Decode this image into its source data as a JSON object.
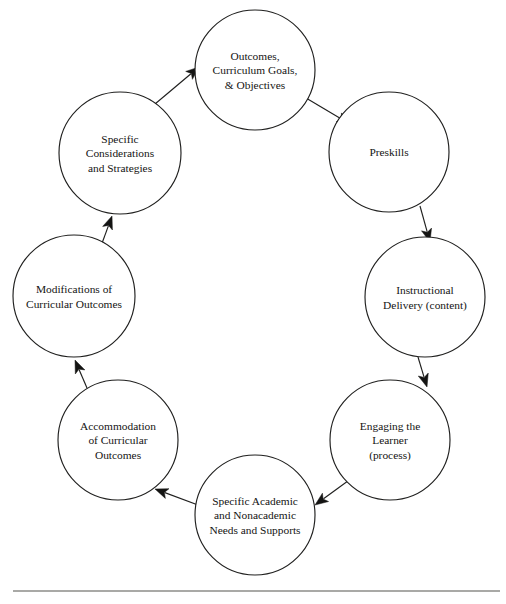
{
  "diagram": {
    "type": "cycle",
    "node_count": 8,
    "stroke_color": "#20201f",
    "arrow_color": "#141413",
    "background_color": "#ffffff",
    "rule_color": "#55544f",
    "nodes": [
      {
        "id": "outcomes",
        "name": "outcomes-curriculum-goals-objectives",
        "lines": [
          "Outcomes,",
          "Curriculum Goals,",
          "& Objectives"
        ],
        "cx": 255,
        "cy": 70,
        "r": 60
      },
      {
        "id": "preskills",
        "name": "preskills",
        "lines": [
          "Preskills"
        ],
        "cx": 389,
        "cy": 152,
        "r": 60
      },
      {
        "id": "instructional-delivery",
        "name": "instructional-delivery-content",
        "lines": [
          "Instructional",
          "Delivery (content)"
        ],
        "cx": 425,
        "cy": 297,
        "r": 60
      },
      {
        "id": "engaging-learner",
        "name": "engaging-the-learner-process",
        "lines": [
          "Engaging the",
          "Learner",
          "(process)"
        ],
        "cx": 390,
        "cy": 440,
        "r": 60
      },
      {
        "id": "specific-academic-needs",
        "name": "specific-academic-and-nonacademic-needs-and-supports",
        "lines": [
          "Specific Academic",
          "and Nonacademic",
          "Needs and Supports"
        ],
        "cx": 255,
        "cy": 515,
        "r": 60
      },
      {
        "id": "accommodation",
        "name": "accommodation-of-curricular-outcomes",
        "lines": [
          "Accommodation",
          "of Curricular",
          "Outcomes"
        ],
        "cx": 118,
        "cy": 440,
        "r": 60
      },
      {
        "id": "modifications",
        "name": "modifications-of-curricular-outcomes",
        "lines": [
          "Modifications of",
          "Curricular Outcomes"
        ],
        "cx": 74,
        "cy": 296,
        "r": 61
      },
      {
        "id": "specific-considerations",
        "name": "specific-considerations-and-strategies",
        "lines": [
          "Specific",
          "Considerations",
          "and Strategies"
        ],
        "cx": 120,
        "cy": 153,
        "r": 61
      }
    ],
    "arrows": [
      {
        "id": "outcomes-to-preskills",
        "from": "outcomes",
        "to": "preskills",
        "x1": 306,
        "y1": 98,
        "x2": 350,
        "y2": 124
      },
      {
        "id": "preskills-to-instructional-delivery",
        "from": "preskills",
        "to": "instructional-delivery",
        "x1": 420,
        "y1": 206,
        "x2": 430,
        "y2": 242
      },
      {
        "id": "instructional-delivery-to-engaging-learner",
        "from": "instructional-delivery",
        "to": "engaging-learner",
        "x1": 418,
        "y1": 357,
        "x2": 427,
        "y2": 387
      },
      {
        "id": "engaging-learner-to-specific-academic-needs",
        "from": "engaging-learner",
        "to": "specific-academic-needs",
        "x1": 352,
        "y1": 478,
        "x2": 315,
        "y2": 505
      },
      {
        "id": "specific-academic-needs-to-accommodation",
        "from": "specific-academic-needs",
        "to": "accommodation",
        "x1": 198,
        "y1": 505,
        "x2": 155,
        "y2": 489
      },
      {
        "id": "accommodation-to-modifications",
        "from": "accommodation",
        "to": "modifications",
        "x1": 87,
        "y1": 388,
        "x2": 75,
        "y2": 360
      },
      {
        "id": "modifications-to-specific-considerations",
        "from": "modifications",
        "to": "specific-considerations",
        "x1": 101,
        "y1": 246,
        "x2": 112,
        "y2": 216
      },
      {
        "id": "specific-considerations-to-outcomes",
        "from": "specific-considerations",
        "to": "outcomes",
        "x1": 155,
        "y1": 104,
        "x2": 199,
        "y2": 67
      }
    ],
    "footer_rule": {
      "name": "footer-rule",
      "x1": 13,
      "x2": 500,
      "y": 591
    }
  }
}
